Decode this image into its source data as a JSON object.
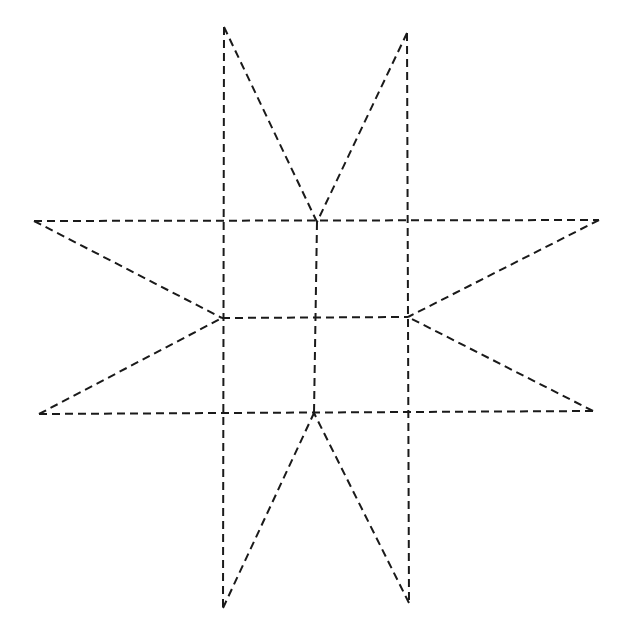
{
  "diagram": {
    "type": "dashed-line-drawing",
    "canvas": {
      "width": 630,
      "height": 644,
      "background": "#ffffff"
    },
    "stroke": {
      "color": "#1a1a1a",
      "width": 2,
      "dash": "8 5"
    },
    "points": {
      "top_left_tip": [
        224,
        27
      ],
      "top_right_tip": [
        407,
        33
      ],
      "left_top_tip": [
        34,
        221
      ],
      "left_bottom_tip": [
        39,
        414
      ],
      "right_top_tip": [
        599,
        220
      ],
      "right_bottom_tip": [
        593,
        411
      ],
      "bottom_left_tip": [
        223,
        608
      ],
      "bottom_right_tip": [
        409,
        603
      ],
      "grid_top_center": [
        317,
        222
      ],
      "grid_mid_left": [
        222,
        318
      ],
      "grid_mid_right": [
        408,
        317
      ],
      "grid_bottom_center": [
        314,
        413
      ],
      "grid_center": [
        315,
        318
      ]
    },
    "lines": [
      {
        "name": "vertical-left-line",
        "from": [
          224,
          27
        ],
        "to": [
          223,
          608
        ]
      },
      {
        "name": "vertical-right-line",
        "from": [
          407,
          33
        ],
        "to": [
          409,
          603
        ]
      },
      {
        "name": "horizontal-top-line",
        "from": [
          34,
          221
        ],
        "to": [
          599,
          220
        ]
      },
      {
        "name": "horizontal-bottom-line",
        "from": [
          39,
          414
        ],
        "to": [
          593,
          411
        ]
      },
      {
        "name": "vertical-middle-line",
        "from": [
          317,
          222
        ],
        "to": [
          314,
          413
        ]
      },
      {
        "name": "horizontal-middle-line",
        "from": [
          222,
          318
        ],
        "to": [
          408,
          317
        ]
      },
      {
        "name": "diagonal-top-left",
        "from": [
          224,
          27
        ],
        "to": [
          317,
          222
        ]
      },
      {
        "name": "diagonal-top-right",
        "from": [
          407,
          33
        ],
        "to": [
          317,
          222
        ]
      },
      {
        "name": "diagonal-left-top",
        "from": [
          34,
          221
        ],
        "to": [
          222,
          318
        ]
      },
      {
        "name": "diagonal-left-bottom",
        "from": [
          39,
          414
        ],
        "to": [
          222,
          318
        ]
      },
      {
        "name": "diagonal-right-top",
        "from": [
          599,
          220
        ],
        "to": [
          408,
          317
        ]
      },
      {
        "name": "diagonal-right-bottom",
        "from": [
          593,
          411
        ],
        "to": [
          408,
          317
        ]
      },
      {
        "name": "diagonal-bottom-left",
        "from": [
          223,
          608
        ],
        "to": [
          314,
          413
        ]
      },
      {
        "name": "diagonal-bottom-right",
        "from": [
          409,
          603
        ],
        "to": [
          314,
          413
        ]
      }
    ]
  }
}
